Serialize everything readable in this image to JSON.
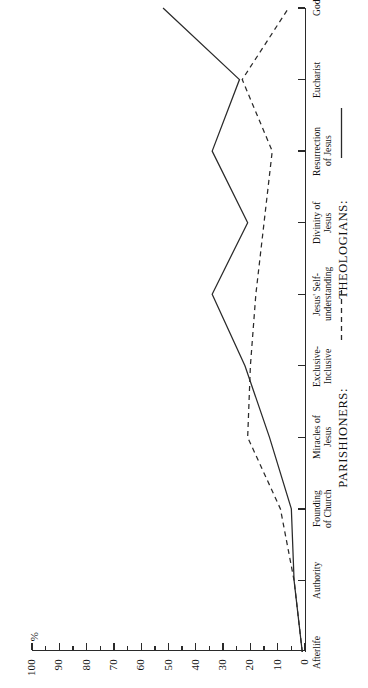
{
  "figure": {
    "orientation": "rotated-90-ccw",
    "axis_title": "%",
    "background": "#ffffff",
    "line_color": "#2a2a2a"
  },
  "legend": {
    "parishioners_label": "PARISHIONERS:",
    "theologians_label": "THEOLOGIANS:",
    "parishioners_style": "dashed",
    "theologians_style": "solid"
  },
  "axis": {
    "y_ticks": [
      "100",
      "90",
      "80",
      "70",
      "60",
      "50",
      "40",
      "30",
      "20",
      "10",
      "0"
    ],
    "minor_tick_step": 5
  },
  "chart_data": {
    "type": "line",
    "title": "",
    "xlabel": "",
    "ylabel": "%",
    "ylim": [
      0,
      100
    ],
    "grid": false,
    "legend_position": "bottom",
    "categories": [
      "Afterlife",
      "Authority",
      "Founding\nof Church",
      "Miracles of\nJesus",
      "Exclusive-\nInclusive",
      "Jesus' Self-\nunderstanding",
      "Divinity of\nJesus",
      "Resurrection\nof Jesus",
      "Eucharist",
      "God"
    ],
    "series": [
      {
        "name": "THEOLOGIANS:",
        "style": "solid",
        "values": [
          1,
          4,
          5,
          13,
          22,
          34,
          21,
          34,
          24,
          52
        ]
      },
      {
        "name": "PARISHIONERS:",
        "style": "dashed",
        "values": [
          1,
          4,
          9,
          21,
          20,
          18,
          15,
          12,
          23,
          6
        ]
      }
    ]
  }
}
